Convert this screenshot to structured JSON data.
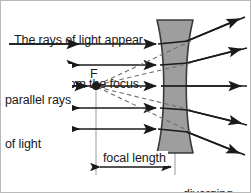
{
  "figure": {
    "type": "optics-ray-diagram",
    "background_color": "#ffffff",
    "border_color": "#b9b9b9",
    "ink_color": "#1a1a1a",
    "lens_fill_color": "#9e9e9e",
    "lens_stroke_color": "#3a3a3a",
    "dashed_ray_color": "#6e6e6e",
    "guide_line_color": "#9a9a9a"
  },
  "captions": {
    "top_line_1": "The rays of light appear",
    "top_line_2": "to come from the focus.",
    "focal_point_label": "F",
    "parallel_rays_line_1": "parallel rays",
    "parallel_rays_line_2": "of light",
    "focal_length_label": "focal length",
    "lens_label_line_1": "diverging",
    "lens_label_line_2": "lens"
  },
  "geometry": {
    "focal_point": {
      "x": 95,
      "y": 85
    },
    "lens_center_x": 174,
    "lens_top_y": 19,
    "lens_bottom_y": 152,
    "focal_length_axis_y": 166,
    "incoming_ray_ys": [
      43,
      64,
      85,
      107,
      128
    ],
    "incoming_ray_start_x": 8,
    "outgoing_ray_end_x": 246,
    "outgoing_ray_end_ys": [
      20,
      47,
      85,
      124,
      152
    ]
  },
  "elements": {
    "incoming_rays_name": "incoming-parallel-ray",
    "outgoing_rays_name": "outgoing-diverged-ray",
    "virtual_rays_name": "virtual-dashed-ray",
    "lens_name": "diverging-lens-shape",
    "focal_point_name": "focal-point-dot",
    "focal_length_arrow_name": "focal-length-dimension-arrow"
  }
}
